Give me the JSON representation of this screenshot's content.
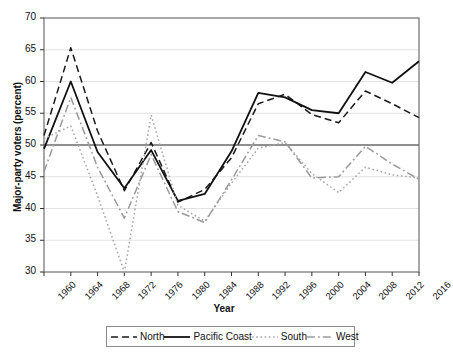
{
  "chart_data": {
    "type": "line",
    "title": "",
    "xlabel": "Year",
    "ylabel": "Major-party voters (percent)",
    "ylim": [
      30,
      70
    ],
    "yticks": [
      30,
      35,
      40,
      45,
      50,
      55,
      60,
      65,
      70
    ],
    "grid": true,
    "reference_line": 50,
    "legend_position": "bottom",
    "categories": [
      1960,
      1964,
      1968,
      1972,
      1976,
      1980,
      1984,
      1988,
      1992,
      1996,
      2000,
      2004,
      2008,
      2012,
      2016
    ],
    "x_tick_labels": [
      "1960",
      "1964",
      "1968",
      "1972",
      "1976",
      "1980",
      "1984",
      "1988",
      "1992",
      "1996",
      "2000",
      "2004",
      "2008",
      "2012",
      "2016"
    ],
    "series": [
      {
        "name": "North",
        "style": "dashed",
        "color": "#1a1a1a",
        "values": [
          51.5,
          65.3,
          52.2,
          42.8,
          50.4,
          41.0,
          43.0,
          48.0,
          56.5,
          58.0,
          54.8,
          53.5,
          58.5,
          56.5,
          54.3
        ]
      },
      {
        "name": "Pacific Coast",
        "style": "solid",
        "color": "#111111",
        "values": [
          49.4,
          60.0,
          48.9,
          43.2,
          49.2,
          41.2,
          42.3,
          49.0,
          58.2,
          57.5,
          55.5,
          55.0,
          61.5,
          59.8,
          63.2
        ]
      },
      {
        "name": "South",
        "style": "dotted",
        "color": "#a6a6a6",
        "values": [
          51.0,
          53.0,
          42.0,
          30.0,
          54.7,
          40.5,
          38.0,
          44.0,
          49.5,
          50.4,
          45.5,
          42.5,
          46.5,
          45.3,
          44.8
        ]
      },
      {
        "name": "West",
        "style": "dashdot",
        "color": "#9a9a9a",
        "values": [
          45.8,
          57.5,
          46.5,
          38.5,
          48.5,
          39.5,
          37.8,
          44.5,
          51.5,
          50.5,
          44.8,
          45.0,
          49.8,
          47.0,
          44.6
        ]
      }
    ]
  },
  "axis": {
    "y_label": "Major-party voters (percent)",
    "x_label": "Year"
  },
  "legend": {
    "items": [
      {
        "label": "North",
        "icon": "dashed-line-icon"
      },
      {
        "label": "Pacific Coast",
        "icon": "solid-line-icon"
      },
      {
        "label": "South",
        "icon": "dotted-line-icon"
      },
      {
        "label": "West",
        "icon": "dashdot-line-icon"
      }
    ]
  }
}
